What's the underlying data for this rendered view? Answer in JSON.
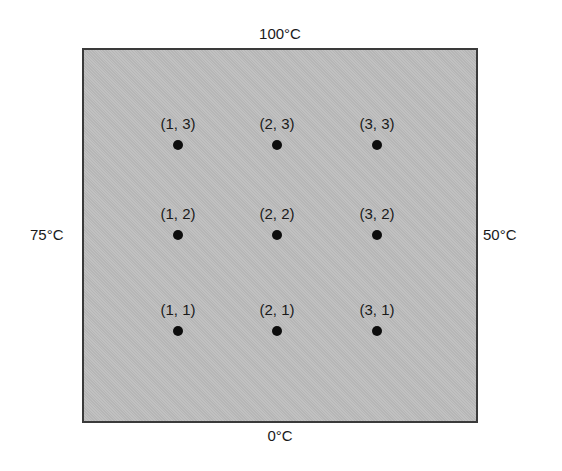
{
  "diagram": {
    "boundaries": {
      "top": "100°C",
      "bottom": "0°C",
      "left": "75°C",
      "right": "50°C"
    },
    "plate_color": "#bdbdbd",
    "border_color": "#3a3a3a",
    "nodes": [
      {
        "label": "(1, 3)",
        "x": 178,
        "y": 145
      },
      {
        "label": "(2, 3)",
        "x": 277,
        "y": 145
      },
      {
        "label": "(3, 3)",
        "x": 377,
        "y": 145
      },
      {
        "label": "(1, 2)",
        "x": 178,
        "y": 235
      },
      {
        "label": "(2, 2)",
        "x": 277,
        "y": 235
      },
      {
        "label": "(3, 2)",
        "x": 377,
        "y": 235
      },
      {
        "label": "(1, 1)",
        "x": 178,
        "y": 331
      },
      {
        "label": "(2, 1)",
        "x": 277,
        "y": 331
      },
      {
        "label": "(3, 1)",
        "x": 377,
        "y": 331
      }
    ]
  }
}
